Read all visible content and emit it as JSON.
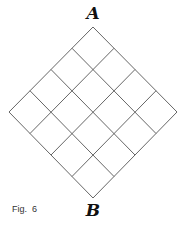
{
  "figure": {
    "caption": "Fig.  6",
    "top_label": "A",
    "bottom_label": "B",
    "grid": {
      "rows": 4,
      "cols": 4,
      "rotation_deg": 45
    },
    "line_color": "#555555"
  }
}
